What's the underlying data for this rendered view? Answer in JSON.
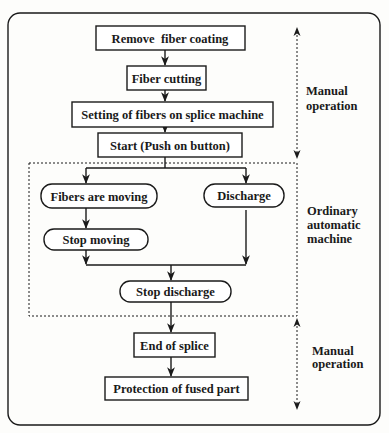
{
  "diagram": {
    "type": "flowchart",
    "colors": {
      "ink": "#1a1a1a",
      "background": "#fdfdfb"
    },
    "nodes": [
      {
        "id": "remove_coating",
        "label": "Remove  fiber coating",
        "shape": "rect"
      },
      {
        "id": "fiber_cutting",
        "label": "Fiber cutting",
        "shape": "rect"
      },
      {
        "id": "setting_fibers",
        "label": "Setting of fibers on splice machine",
        "shape": "rect"
      },
      {
        "id": "start",
        "label": "Start (Push on button)",
        "shape": "rect"
      },
      {
        "id": "fibers_moving",
        "label": "Fibers are moving",
        "shape": "rounded"
      },
      {
        "id": "discharge",
        "label": "Discharge",
        "shape": "rounded"
      },
      {
        "id": "stop_moving",
        "label": "Stop moving",
        "shape": "rounded"
      },
      {
        "id": "stop_discharge",
        "label": "Stop discharge",
        "shape": "rounded"
      },
      {
        "id": "end_splice",
        "label": "End of splice",
        "shape": "rect"
      },
      {
        "id": "protection",
        "label": "Protection of fused part",
        "shape": "rect"
      }
    ],
    "edges": [
      {
        "from": "remove_coating",
        "to": "fiber_cutting"
      },
      {
        "from": "fiber_cutting",
        "to": "setting_fibers"
      },
      {
        "from": "setting_fibers",
        "to": "start"
      },
      {
        "from": "start",
        "to": "fibers_moving"
      },
      {
        "from": "start",
        "to": "discharge"
      },
      {
        "from": "fibers_moving",
        "to": "stop_moving"
      },
      {
        "from": "stop_moving",
        "to": "stop_discharge"
      },
      {
        "from": "discharge",
        "to": "stop_discharge"
      },
      {
        "from": "stop_discharge",
        "to": "end_splice"
      },
      {
        "from": "end_splice",
        "to": "protection"
      }
    ],
    "regions": [
      {
        "id": "manual_top",
        "label_line1": "Manual",
        "label_line2": "operation"
      },
      {
        "id": "automatic",
        "label_line1": "Ordinary",
        "label_line2": "automatic",
        "label_line3": "machine"
      },
      {
        "id": "manual_bottom",
        "label_line1": "Manual",
        "label_line2": "operation"
      }
    ]
  }
}
